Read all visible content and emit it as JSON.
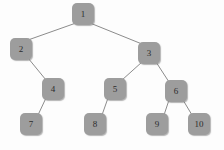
{
  "figure": {
    "background_color": "#fdfdfd",
    "node_color": "#9d9d9d",
    "edge_color": "#8c8c8c",
    "label_color": "#2c2c2c"
  },
  "chart_data": {
    "type": "diagram",
    "diagram_type": "binary-tree",
    "title": "",
    "node_count": 10,
    "nodes": [
      {
        "id": "1",
        "label": "1",
        "x": 83,
        "y": 14,
        "level": 0
      },
      {
        "id": "2",
        "label": "2",
        "x": 21,
        "y": 49,
        "level": 1
      },
      {
        "id": "3",
        "label": "3",
        "x": 149,
        "y": 53,
        "level": 1
      },
      {
        "id": "4",
        "label": "4",
        "x": 53,
        "y": 89,
        "level": 2
      },
      {
        "id": "5",
        "label": "5",
        "x": 115,
        "y": 89,
        "level": 2
      },
      {
        "id": "6",
        "label": "6",
        "x": 176,
        "y": 91,
        "level": 2
      },
      {
        "id": "7",
        "label": "7",
        "x": 31,
        "y": 124,
        "level": 3
      },
      {
        "id": "8",
        "label": "8",
        "x": 95,
        "y": 124,
        "level": 3
      },
      {
        "id": "9",
        "label": "9",
        "x": 157,
        "y": 124,
        "level": 3
      },
      {
        "id": "10",
        "label": "10",
        "x": 199,
        "y": 124,
        "level": 3
      }
    ],
    "edges": [
      {
        "from": "1",
        "to": "2",
        "side": "left"
      },
      {
        "from": "1",
        "to": "3",
        "side": "right"
      },
      {
        "from": "2",
        "to": "4",
        "side": "right"
      },
      {
        "from": "4",
        "to": "7",
        "side": "left"
      },
      {
        "from": "3",
        "to": "5",
        "side": "left"
      },
      {
        "from": "3",
        "to": "6",
        "side": "right"
      },
      {
        "from": "5",
        "to": "8",
        "side": "left"
      },
      {
        "from": "6",
        "to": "9",
        "side": "left"
      },
      {
        "from": "6",
        "to": "10",
        "side": "right"
      }
    ]
  }
}
